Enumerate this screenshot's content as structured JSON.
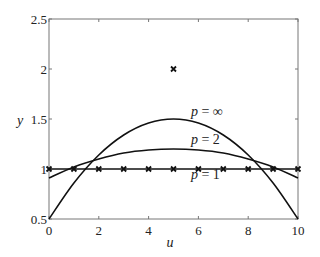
{
  "chart_data": {
    "type": "line",
    "title": "",
    "xlabel": "u",
    "ylabel": "y",
    "xlim": [
      0,
      10
    ],
    "ylim": [
      0.5,
      2.5
    ],
    "xticks": [
      0,
      2,
      4,
      6,
      8,
      10
    ],
    "xtick_labels": [
      "0",
      "2",
      "4",
      "6",
      "8",
      "10"
    ],
    "yticks": [
      0.5,
      1,
      1.5,
      2,
      2.5
    ],
    "ytick_labels": [
      "0.5",
      "1",
      "1.5",
      "2",
      "2.5"
    ],
    "grid": false,
    "legend": null,
    "series": [
      {
        "name": "p = 1",
        "style": "line with x markers",
        "x": [
          0,
          1,
          2,
          3,
          4,
          5,
          6,
          7,
          8,
          9,
          10
        ],
        "values": [
          1,
          1,
          1,
          1,
          1,
          1,
          1,
          1,
          1,
          1,
          1
        ]
      },
      {
        "name": "p = 2",
        "style": "line",
        "x": [
          0,
          1,
          2,
          3,
          4,
          5,
          6,
          7,
          8,
          9,
          10
        ],
        "values": [
          0.91,
          1.02,
          1.1,
          1.16,
          1.19,
          1.2,
          1.19,
          1.16,
          1.1,
          1.02,
          0.91
        ]
      },
      {
        "name": "p = ∞",
        "style": "line",
        "x": [
          0,
          1,
          2,
          3,
          4,
          5,
          6,
          7,
          8,
          9,
          10
        ],
        "values": [
          0.5,
          0.86,
          1.14,
          1.34,
          1.46,
          1.5,
          1.46,
          1.34,
          1.14,
          0.86,
          0.5
        ]
      },
      {
        "name": "isolated point",
        "style": "x marker only",
        "x": [
          5
        ],
        "values": [
          2
        ]
      }
    ],
    "annotations": [
      {
        "text_var": "p",
        "text_rest": " = ∞",
        "u": 5.7,
        "y": 1.53
      },
      {
        "text_var": "p",
        "text_rest": " = 2",
        "u": 5.7,
        "y": 1.25
      },
      {
        "text_var": "p",
        "text_rest": " = 1",
        "u": 5.7,
        "y": 0.9
      }
    ]
  }
}
